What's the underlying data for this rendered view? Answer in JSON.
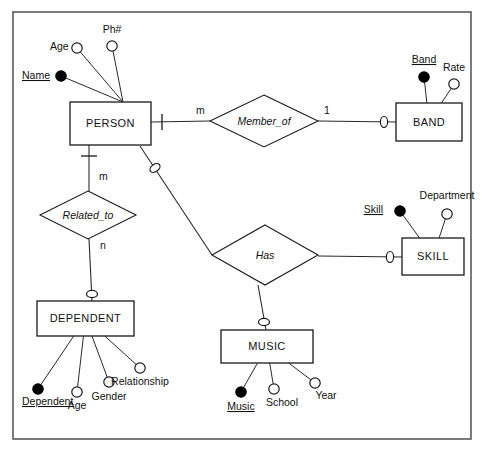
{
  "diagram": {
    "notation": "chen",
    "frame": {
      "x": 13,
      "y": 12,
      "width": 458,
      "height": 427,
      "color": "#5a5a5a"
    },
    "entities": [
      {
        "id": "person",
        "label": "PERSON",
        "x": 70,
        "y": 102,
        "width": 81,
        "height": 43,
        "attributes": [
          {
            "name": "Name",
            "key": true,
            "cx": 61,
            "cy": 76,
            "lx": 22,
            "ly": 79,
            "anchor": "start"
          },
          {
            "name": "Age",
            "key": false,
            "cx": 77,
            "cy": 48,
            "lx": 50,
            "ly": 50,
            "anchor": "start"
          },
          {
            "name": "Ph#",
            "key": false,
            "cx": 112,
            "cy": 46,
            "lx": 112,
            "ly": 33,
            "anchor": "middle"
          }
        ],
        "attr_anchor": {
          "x": 123,
          "y": 102
        }
      },
      {
        "id": "band",
        "label": "BAND",
        "x": 396,
        "y": 103,
        "width": 66,
        "height": 38,
        "attributes": [
          {
            "name": "Band",
            "key": true,
            "cx": 424,
            "cy": 77,
            "lx": 424,
            "ly": 63,
            "anchor": "middle"
          },
          {
            "name": "Rate",
            "key": false,
            "cx": 454,
            "cy": 84,
            "lx": 454,
            "ly": 71,
            "anchor": "middle"
          }
        ]
      },
      {
        "id": "dependent",
        "label": "DEPENDENT",
        "x": 37,
        "y": 301,
        "width": 97,
        "height": 35,
        "attributes": [
          {
            "name": "Dependent",
            "key": true,
            "cx": 38,
            "cy": 389,
            "lx": 22,
            "ly": 405,
            "anchor": "start"
          },
          {
            "name": "Age",
            "key": false,
            "cx": 77,
            "cy": 392,
            "lx": 77,
            "ly": 409,
            "anchor": "middle"
          },
          {
            "name": "Gender",
            "key": false,
            "cx": 109,
            "cy": 382,
            "lx": 109,
            "ly": 400,
            "anchor": "middle"
          },
          {
            "name": "Relationship",
            "key": false,
            "cx": 140,
            "cy": 368,
            "lx": 140,
            "ly": 385,
            "anchor": "middle"
          }
        ]
      },
      {
        "id": "music",
        "label": "MUSIC",
        "x": 221,
        "y": 330,
        "width": 92,
        "height": 33,
        "attributes": [
          {
            "name": "Music",
            "key": true,
            "cx": 241,
            "cy": 392,
            "lx": 241,
            "ly": 410,
            "anchor": "middle"
          },
          {
            "name": "School",
            "key": false,
            "cx": 274,
            "cy": 389,
            "lx": 282,
            "ly": 406,
            "anchor": "middle"
          },
          {
            "name": "Year",
            "key": false,
            "cx": 315,
            "cy": 383,
            "lx": 326,
            "ly": 399,
            "anchor": "middle"
          }
        ]
      },
      {
        "id": "skill",
        "label": "SKILL",
        "x": 402,
        "y": 238,
        "width": 62,
        "height": 37,
        "attributes": [
          {
            "name": "Skill",
            "key": true,
            "cx": 400,
            "cy": 211,
            "lx": 383,
            "ly": 213,
            "anchor": "end"
          },
          {
            "name": "Department",
            "key": false,
            "cx": 447,
            "cy": 214,
            "lx": 447,
            "ly": 199,
            "anchor": "middle"
          }
        ]
      }
    ],
    "relationships": [
      {
        "id": "member_of",
        "label": "Member_of",
        "cx": 264,
        "cy": 121,
        "rx": 54,
        "ry": 26
      },
      {
        "id": "related_to",
        "label": "Related_to",
        "cx": 88,
        "cy": 215,
        "rx": 48,
        "ry": 24
      },
      {
        "id": "has",
        "label": "Has",
        "cx": 265,
        "cy": 255,
        "rx": 53,
        "ry": 30
      }
    ],
    "cardinalities": [
      {
        "value": "m",
        "x": 196,
        "y": 114
      },
      {
        "value": "1",
        "x": 324,
        "y": 114
      },
      {
        "value": "m",
        "x": 99,
        "y": 180
      },
      {
        "value": "n",
        "x": 100,
        "y": 249
      }
    ],
    "connectors": [
      {
        "id": "person-member_of",
        "from": "person",
        "to": "member_of",
        "points": "151,122 210,121"
      },
      {
        "id": "member_of-band",
        "from": "member_of",
        "to": "band",
        "points": "318,121 396,122"
      },
      {
        "id": "person-related_to",
        "from": "person",
        "to": "related_to",
        "points": "89,145 89,191"
      },
      {
        "id": "related_to-dep",
        "from": "related_to",
        "to": "dependent",
        "points": "89,239 92,301"
      },
      {
        "id": "person-has",
        "from": "person",
        "to": "has",
        "points": "140,146 212,255"
      },
      {
        "id": "has-skill",
        "from": "has",
        "to": "skill",
        "points": "318,256 402,257"
      },
      {
        "id": "has-music",
        "from": "has",
        "to": "music",
        "points": "258,285 266,330"
      }
    ],
    "markers": [
      {
        "id": "mandatory-person-member_of",
        "type": "mandatory",
        "x": 162,
        "y": 122,
        "angle": 0
      },
      {
        "id": "mandatory-person-related_to",
        "type": "mandatory",
        "x": 89,
        "y": 156,
        "angle": 90
      },
      {
        "id": "optional-person-has",
        "type": "optional",
        "x": 155,
        "y": 168,
        "angle": 56
      },
      {
        "id": "optional-band",
        "type": "optional",
        "x": 384,
        "y": 122,
        "angle": 0
      },
      {
        "id": "optional-dependent",
        "type": "optional",
        "x": 92,
        "y": 294,
        "angle": 90
      },
      {
        "id": "optional-skill",
        "type": "optional",
        "x": 390,
        "y": 257,
        "angle": 0
      },
      {
        "id": "optional-music",
        "type": "optional",
        "x": 264,
        "y": 322,
        "angle": 90
      }
    ]
  }
}
